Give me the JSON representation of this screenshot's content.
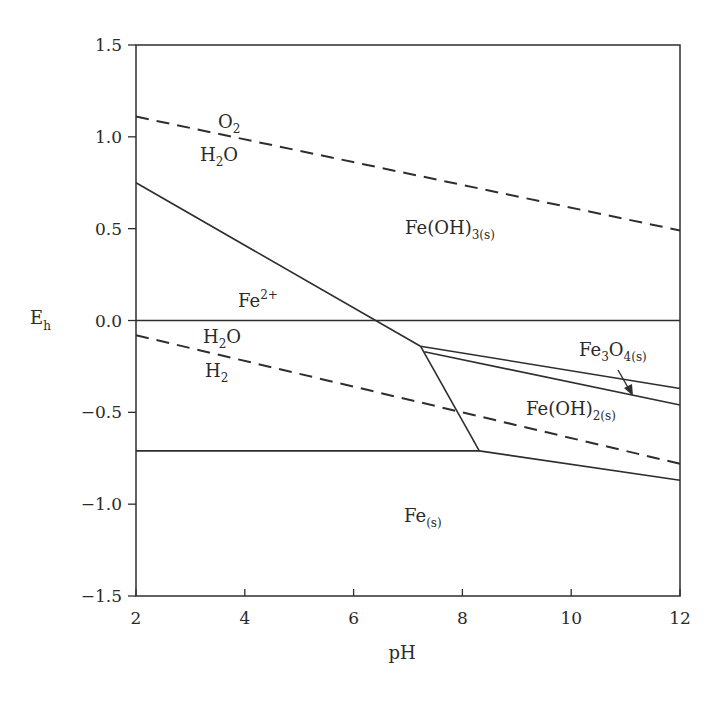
{
  "chart_data": {
    "type": "line",
    "title": "",
    "subtitle": "",
    "xlabel": "pH",
    "ylabel": "Eh",
    "xlim": [
      2,
      12
    ],
    "ylim": [
      -1.5,
      1.5
    ],
    "grid": false,
    "legend": null,
    "x_ticks": [
      2,
      4,
      6,
      8,
      10,
      12
    ],
    "x_tick_labels": [
      "2",
      "4",
      "6",
      "8",
      "10",
      "12"
    ],
    "y_ticks": [
      1.5,
      1.0,
      0.5,
      0.0,
      -0.5,
      -1.0,
      -1.5
    ],
    "y_tick_labels": [
      "1.5",
      "1.0",
      "0.5",
      "0.0",
      "−0.5",
      "−1.0",
      "−1.5"
    ],
    "series": [
      {
        "name": "O2/H2O water stability limit",
        "style": "dashed",
        "x": [
          2,
          12
        ],
        "y": [
          1.11,
          0.49
        ]
      },
      {
        "name": "Fe2+/Fe(OH)3(s) boundary",
        "style": "solid",
        "x": [
          2,
          7.23
        ],
        "y": [
          0.75,
          -0.14
        ]
      },
      {
        "name": "Eh = 0 reference line",
        "style": "solid",
        "x": [
          2,
          12
        ],
        "y": [
          0.0,
          0.0
        ]
      },
      {
        "name": "H2O/H2 water stability limit",
        "style": "dashed",
        "x": [
          2,
          12
        ],
        "y": [
          -0.08,
          -0.78
        ]
      },
      {
        "name": "Fe2+/Fe(s) and Fe(OH)2(s)/Fe(s) boundary",
        "style": "solid",
        "x": [
          2,
          8.31,
          12
        ],
        "y": [
          -0.71,
          -0.71,
          -0.87
        ]
      },
      {
        "name": "Fe2+/Fe(OH)2(s) boundary",
        "style": "solid",
        "x": [
          7.23,
          8.31
        ],
        "y": [
          -0.14,
          -0.71
        ]
      },
      {
        "name": "Fe(OH)3(s)/Fe3O4(s) boundary",
        "style": "solid",
        "x": [
          7.23,
          12
        ],
        "y": [
          -0.14,
          -0.37
        ]
      },
      {
        "name": "Fe3O4(s)/Fe(OH)2(s) boundary",
        "style": "solid",
        "x": [
          7.3,
          12
        ],
        "y": [
          -0.17,
          -0.46
        ]
      }
    ],
    "annotations": [
      {
        "text": "O2",
        "x": 3.8,
        "y": 1.04
      },
      {
        "text": "H2O",
        "x": 3.8,
        "y": 0.87
      },
      {
        "text": "Fe(OH)3(s)",
        "x": 9.2,
        "y": 0.48
      },
      {
        "text": "Fe2+",
        "x": 4.2,
        "y": 0.05
      },
      {
        "text": "H2O",
        "x": 4.0,
        "y": -0.12
      },
      {
        "text": "H2",
        "x": 4.0,
        "y": -0.31
      },
      {
        "text": "Fe3O4(s)",
        "x": 10.8,
        "y": -0.18,
        "arrow_to": [
          11.0,
          -0.34
        ]
      },
      {
        "text": "Fe(OH)2(s)",
        "x": 9.9,
        "y": -0.53
      },
      {
        "text": "Fe(s)",
        "x": 7.6,
        "y": -1.12
      }
    ]
  },
  "labels": {
    "x_axis_title": "pH",
    "y_axis_title_main": "E",
    "y_axis_title_sub": "h",
    "o2": {
      "main": "O",
      "sub": "2"
    },
    "h2o_top": {
      "a": "H",
      "sub": "2",
      "b": "O"
    },
    "feoh3": {
      "main": "Fe(OH)",
      "sub": "3(s)"
    },
    "fe2": {
      "main": "Fe",
      "sup": "2+"
    },
    "h2o_bottom": {
      "a": "H",
      "sub": "2",
      "b": "O"
    },
    "h2": {
      "main": "H",
      "sub": "2"
    },
    "fe3o4": {
      "a": "Fe",
      "sub1": "3",
      "b": "O",
      "sub2": "4(s)"
    },
    "feoh2": {
      "main": "Fe(OH)",
      "sub": "2(s)"
    },
    "fes": {
      "main": "Fe",
      "sub": "(s)"
    }
  },
  "colors": {
    "line": "#2e2e2e",
    "text": "#2a2a2a",
    "background": "#ffffff"
  }
}
